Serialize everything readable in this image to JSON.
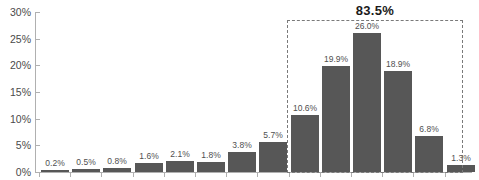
{
  "chart_data": {
    "type": "bar",
    "title": "",
    "xlabel": "",
    "ylabel": "",
    "ylim": [
      0,
      30
    ],
    "ytick_labels": [
      "0%",
      "5%",
      "10%",
      "15%",
      "20%",
      "25%",
      "30%"
    ],
    "ytick_values": [
      0,
      5,
      10,
      15,
      20,
      25,
      30
    ],
    "grid": false,
    "legend": null,
    "categories": [
      "",
      "",
      "",
      "",
      "",
      "",
      "",
      "",
      "",
      "",
      "",
      "",
      "",
      ""
    ],
    "values": [
      0.2,
      0.5,
      0.8,
      1.6,
      2.1,
      1.8,
      3.8,
      5.7,
      10.6,
      19.9,
      26.0,
      18.9,
      6.8,
      1.3
    ],
    "data_labels": [
      "0.2%",
      "0.5%",
      "0.8%",
      "1.6%",
      "2.1%",
      "1.8%",
      "3.8%",
      "5.7%",
      "10.6%",
      "19.9%",
      "26.0%",
      "18.9%",
      "6.8%",
      "1.3%"
    ],
    "annotations": [
      {
        "name": "highlighted-range-total",
        "text": "83.5%",
        "covers_bars": [
          8,
          9,
          10,
          11,
          12,
          13
        ],
        "style": "dashed-box"
      }
    ],
    "colors": {
      "bar": "#575757",
      "axis": "#b0b0b0",
      "label_text": "#4f4f4f",
      "annotation_text": "#1a1a1a",
      "annotation_border": "#7a7a7a",
      "background": "#ffffff"
    }
  },
  "axis": {
    "y_labels": [
      "30%",
      "25%",
      "20%",
      "15%",
      "10%",
      "5%",
      "0%"
    ]
  },
  "highlight": {
    "total_label": "83.5%"
  }
}
